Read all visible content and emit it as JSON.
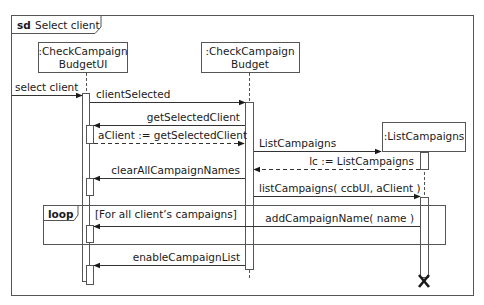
{
  "frame": {
    "keyword": "sd",
    "title": "Select client"
  },
  "lifelines": [
    {
      "id": "ui",
      "line1": ":CheckCampaign",
      "line2": "BudgetUI"
    },
    {
      "id": "ctrl",
      "line1": ":CheckCampaign",
      "line2": "Budget"
    },
    {
      "id": "list",
      "line1": ":ListCampaigns",
      "line2": ""
    }
  ],
  "messages": [
    {
      "label": "select client",
      "from": "actor",
      "to": "ui",
      "kind": "sync"
    },
    {
      "label": "clientSelected",
      "from": "ui",
      "to": "ctrl",
      "kind": "sync"
    },
    {
      "label": "getSelectedClient",
      "from": "ctrl",
      "to": "ui",
      "kind": "sync"
    },
    {
      "label": "aClient := getSelectedClient",
      "from": "ui",
      "to": "ctrl",
      "kind": "reply"
    },
    {
      "label": "ListCampaigns",
      "from": "ctrl",
      "to": "list",
      "kind": "create"
    },
    {
      "label": "lc := ListCampaigns",
      "from": "list",
      "to": "ctrl",
      "kind": "reply"
    },
    {
      "label": "clearAllCampaignNames",
      "from": "ctrl",
      "to": "ui",
      "kind": "sync"
    },
    {
      "label": "listCampaigns( ccbUI, aClient )",
      "from": "ctrl",
      "to": "list",
      "kind": "sync"
    },
    {
      "label": "addCampaignName( name )",
      "from": "list",
      "to": "ui",
      "kind": "sync"
    },
    {
      "label": "enableCampaignList",
      "from": "ctrl",
      "to": "ui",
      "kind": "sync"
    }
  ],
  "fragments": [
    {
      "operator": "loop",
      "guard": "[For all client’s campaigns]"
    }
  ],
  "destruction": {
    "lifeline": "list",
    "symbol": "X"
  }
}
